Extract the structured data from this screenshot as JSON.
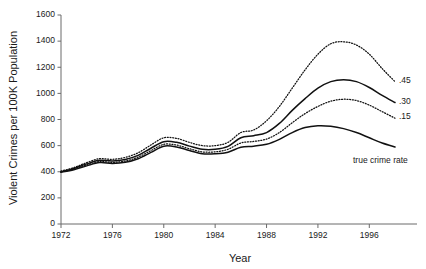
{
  "chart_data": {
    "type": "line",
    "title": "",
    "xlabel": "Year",
    "ylabel": "Violent Crimes per 100K Population",
    "xlim": [
      1972,
      1998
    ],
    "ylim": [
      0,
      1600
    ],
    "grid": false,
    "legend_position": "inline-right-end-labels",
    "xticks": [
      1972,
      1976,
      1980,
      1984,
      1988,
      1992,
      1996
    ],
    "xtick_labels": [
      "1972",
      "1976",
      "1980",
      "1984",
      "1988",
      "1992",
      "1996"
    ],
    "yticks": [
      0,
      200,
      400,
      600,
      800,
      1000,
      1200,
      1400,
      1600
    ],
    "ytick_labels": [
      "0",
      "200",
      "400",
      "600",
      "800",
      "1000",
      "1200",
      "1400",
      "1600"
    ],
    "x": [
      1972,
      1973,
      1974,
      1975,
      1976,
      1977,
      1978,
      1979,
      1980,
      1981,
      1982,
      1983,
      1984,
      1985,
      1986,
      1987,
      1988,
      1989,
      1990,
      1991,
      1992,
      1993,
      1994,
      1995,
      1996,
      1997,
      1998
    ],
    "series": [
      {
        "name": ".45",
        "label": ".45",
        "style": "dotted",
        "color": "#111111",
        "values": [
          405,
          432,
          470,
          500,
          495,
          510,
          545,
          605,
          660,
          655,
          625,
          600,
          600,
          625,
          700,
          720,
          790,
          900,
          1040,
          1180,
          1300,
          1380,
          1395,
          1370,
          1300,
          1190,
          1090
        ]
      },
      {
        "name": ".30",
        "label": ".30",
        "style": "solid",
        "color": "#111111",
        "values": [
          400,
          425,
          460,
          488,
          482,
          494,
          525,
          580,
          630,
          625,
          596,
          572,
          572,
          594,
          660,
          676,
          700,
          770,
          870,
          960,
          1040,
          1090,
          1105,
          1090,
          1045,
          985,
          930
        ]
      },
      {
        "name": ".15",
        "label": ".15",
        "style": "dotted",
        "color": "#111111",
        "values": [
          398,
          420,
          452,
          478,
          472,
          482,
          512,
          562,
          610,
          604,
          576,
          552,
          552,
          572,
          620,
          632,
          650,
          700,
          775,
          845,
          900,
          940,
          955,
          945,
          910,
          860,
          810
        ]
      },
      {
        "name": "true crime rate",
        "label": "true crime rate",
        "style": "solid",
        "color": "#111111",
        "values": [
          396,
          415,
          445,
          470,
          464,
          472,
          500,
          548,
          596,
          590,
          562,
          538,
          538,
          550,
          588,
          596,
          610,
          648,
          700,
          738,
          752,
          748,
          730,
          700,
          660,
          620,
          590
        ]
      }
    ]
  }
}
